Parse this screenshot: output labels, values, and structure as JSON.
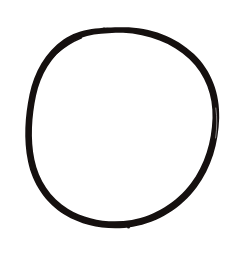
{
  "canvas": {
    "width": 240,
    "height": 266,
    "background_color": "#ffffff"
  },
  "figure": {
    "name": "hand-drawn-circle",
    "kind": "line-drawing",
    "description": "A single large hand-drawn circle outline, slightly irregular, centered on a plain white background.",
    "ink_color": "#15100f",
    "shapes": [
      {
        "type": "circle",
        "center_x": 123,
        "center_y": 127,
        "radius_x": 96,
        "radius_y": 100,
        "stroke_color": "#15100f",
        "stroke_width_min": 3.4,
        "stroke_width_max": 6.2,
        "fill": "none",
        "closed": true,
        "bounds": {
          "left": 26,
          "top": 27,
          "right": 219,
          "bottom": 228
        }
      }
    ]
  },
  "labels": {
    "none": ""
  }
}
